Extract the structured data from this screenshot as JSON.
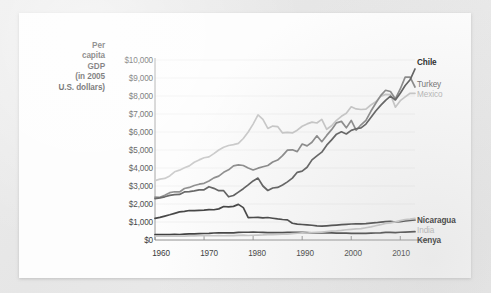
{
  "figure": {
    "background_color": "#fdfdfd",
    "page_background_color": "#e9e9e9"
  },
  "axis": {
    "y_title_lines": [
      "Per",
      "capita",
      "GDP",
      "(in 2005",
      "U.S. dollars)"
    ],
    "y_ticks": [
      "$10,000",
      "$9,000",
      "$8,000",
      "$7,000",
      "$6,000",
      "$5,000",
      "$4,000",
      "$3,000",
      "$2,000",
      "$1,000",
      "$0"
    ],
    "x_ticks": [
      "1960",
      "1970",
      "1980",
      "1990",
      "2000",
      "2010"
    ]
  },
  "series_labels": [
    {
      "name": "Chile",
      "color": "#555555",
      "style": "dark"
    },
    {
      "name": "Turkey",
      "color": "#7b7b7b",
      "style": "mid"
    },
    {
      "name": "Mexico",
      "color": "#c0c0c0",
      "style": "light"
    },
    {
      "name": "Nicaragua",
      "color": "#3a3a3a",
      "style": "dark"
    },
    {
      "name": "India",
      "color": "#c0c0c0",
      "style": "light"
    },
    {
      "name": "Kenya",
      "color": "#3a3a3a",
      "style": "dark"
    }
  ],
  "chart_data": {
    "type": "line",
    "title": "",
    "xlabel": "",
    "ylabel": "Per capita GDP (in 2005 U.S. dollars)",
    "xlim": [
      1960,
      2013
    ],
    "ylim": [
      0,
      10000
    ],
    "grid": "horizontal",
    "legend_position": "right-inline-labels",
    "x": [
      1960,
      1961,
      1962,
      1963,
      1964,
      1965,
      1966,
      1967,
      1968,
      1969,
      1970,
      1971,
      1972,
      1973,
      1974,
      1975,
      1976,
      1977,
      1978,
      1979,
      1980,
      1981,
      1982,
      1983,
      1984,
      1985,
      1986,
      1987,
      1988,
      1989,
      1990,
      1991,
      1992,
      1993,
      1994,
      1995,
      1996,
      1997,
      1998,
      1999,
      2000,
      2001,
      2002,
      2003,
      2004,
      2005,
      2006,
      2007,
      2008,
      2009,
      2010,
      2011,
      2012,
      2013
    ],
    "series": [
      {
        "name": "Mexico",
        "color": "#c6c6c6",
        "values": [
          3300,
          3380,
          3420,
          3560,
          3790,
          3880,
          4010,
          4120,
          4320,
          4450,
          4570,
          4620,
          4800,
          5000,
          5150,
          5250,
          5300,
          5370,
          5640,
          6000,
          6440,
          6950,
          6700,
          6200,
          6330,
          6300,
          5950,
          5980,
          5950,
          6100,
          6320,
          6450,
          6550,
          6500,
          6700,
          6150,
          6350,
          6650,
          6870,
          7040,
          7400,
          7280,
          7250,
          7270,
          7500,
          7680,
          7980,
          8090,
          8080,
          7380,
          7740,
          7950,
          8150,
          8150
        ]
      },
      {
        "name": "Turkey",
        "color": "#868686",
        "values": [
          2380,
          2370,
          2480,
          2630,
          2680,
          2670,
          2860,
          2920,
          3030,
          3100,
          3150,
          3280,
          3450,
          3550,
          3760,
          3900,
          4120,
          4170,
          4140,
          4000,
          3890,
          3990,
          4070,
          4140,
          4330,
          4440,
          4690,
          4990,
          5010,
          4910,
          5330,
          5230,
          5430,
          5790,
          5460,
          5810,
          6130,
          6510,
          6590,
          6230,
          6640,
          6100,
          6400,
          6650,
          7150,
          7600,
          8020,
          8320,
          8250,
          7840,
          8390,
          9050,
          9050,
          8500
        ]
      },
      {
        "name": "Chile",
        "color": "#5a5a5a",
        "values": [
          2300,
          2340,
          2400,
          2480,
          2520,
          2530,
          2670,
          2690,
          2730,
          2780,
          2790,
          2960,
          2870,
          2740,
          2740,
          2400,
          2470,
          2660,
          2850,
          3060,
          3280,
          3440,
          3000,
          2750,
          2890,
          2920,
          3060,
          3230,
          3440,
          3760,
          3830,
          4040,
          4450,
          4670,
          4880,
          5270,
          5560,
          5880,
          6010,
          5890,
          6090,
          6180,
          6230,
          6440,
          6800,
          7170,
          7480,
          7760,
          7990,
          7780,
          8150,
          8580,
          8900,
          9500
        ]
      },
      {
        "name": "Nicaragua",
        "color": "#3e3e3e",
        "values": [
          1200,
          1260,
          1330,
          1400,
          1480,
          1560,
          1590,
          1640,
          1630,
          1650,
          1660,
          1690,
          1680,
          1730,
          1860,
          1840,
          1870,
          1980,
          1800,
          1240,
          1250,
          1260,
          1230,
          1250,
          1210,
          1170,
          1140,
          1120,
          930,
          880,
          860,
          840,
          820,
          780,
          770,
          790,
          810,
          830,
          850,
          870,
          890,
          900,
          900,
          910,
          940,
          960,
          990,
          1020,
          1040,
          1000,
          1020,
          1060,
          1090,
          1110
        ]
      },
      {
        "name": "Kenya",
        "color": "#3e3e3e",
        "values": [
          300,
          300,
          305,
          300,
          315,
          305,
          330,
          335,
          345,
          355,
          360,
          370,
          390,
          395,
          400,
          395,
          400,
          420,
          430,
          430,
          435,
          430,
          425,
          415,
          405,
          405,
          415,
          420,
          425,
          425,
          425,
          415,
          400,
          390,
          390,
          395,
          395,
          385,
          385,
          380,
          370,
          375,
          370,
          370,
          380,
          390,
          400,
          420,
          420,
          415,
          430,
          440,
          450,
          460
        ]
      },
      {
        "name": "India",
        "color": "#c6c6c6",
        "values": [
          210,
          210,
          210,
          220,
          230,
          215,
          210,
          225,
          225,
          235,
          245,
          240,
          235,
          240,
          235,
          250,
          245,
          260,
          270,
          250,
          265,
          275,
          280,
          295,
          300,
          310,
          320,
          330,
          355,
          375,
          395,
          390,
          405,
          420,
          440,
          465,
          495,
          510,
          535,
          570,
          595,
          615,
          635,
          680,
          730,
          790,
          850,
          920,
          955,
          1005,
          1075,
          1130,
          1160,
          1200
        ]
      }
    ]
  }
}
